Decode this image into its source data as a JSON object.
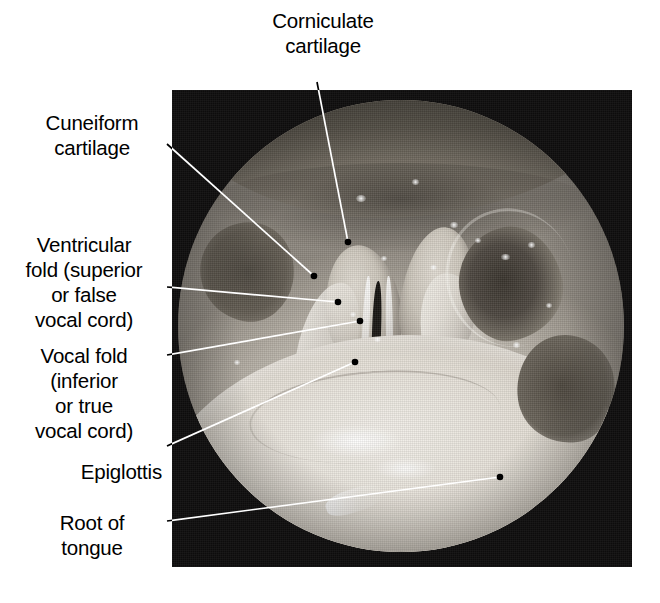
{
  "figure": {
    "type": "laryngoscopic-photograph",
    "view": "superior view of the larynx through a laryngoscope",
    "background_color": "#ffffff",
    "plate_color": "#0d0c0c",
    "leader_color_on_white": "#000000",
    "leader_color_on_photo": "#ffffff"
  },
  "labels": [
    {
      "id": "corniculate-cartilage",
      "text": "Corniculate\ncartilage",
      "align": "center",
      "x": 253,
      "y": 8,
      "width": 140
    },
    {
      "id": "cuneiform-cartilage",
      "text": "Cuneiform\ncartilage",
      "align": "center",
      "x": 22,
      "y": 110,
      "width": 140
    },
    {
      "id": "ventricular-fold",
      "text": "Ventricular\nfold (superior\nor false\nvocal cord)",
      "align": "center",
      "x": 6,
      "y": 232,
      "width": 156
    },
    {
      "id": "vocal-fold",
      "text": "Vocal fold\n(inferior\nor true\nvocal cord)",
      "align": "center",
      "x": 6,
      "y": 343,
      "width": 156
    },
    {
      "id": "epiglottis",
      "text": "Epiglottis",
      "align": "right",
      "x": 22,
      "y": 459,
      "width": 140
    },
    {
      "id": "root-of-tongue",
      "text": "Root of\ntongue",
      "align": "center",
      "x": 22,
      "y": 510,
      "width": 140
    }
  ],
  "leaders": [
    {
      "id": "leader-corniculate-cartilage",
      "points": "317,82 348,242",
      "dot": "348,242"
    },
    {
      "id": "leader-cuneiform-cartilage",
      "points": "167,144 314,276",
      "dot": "314,276"
    },
    {
      "id": "leader-ventricular-fold",
      "points": "167,287 338,302",
      "dot": "338,302"
    },
    {
      "id": "leader-vocal-fold",
      "points": "167,355 360,321",
      "dot": "360,321"
    },
    {
      "id": "leader-epiglottis",
      "points": "167,446 355,362",
      "dot": "355,362"
    },
    {
      "id": "leader-root-of-tongue",
      "points": "167,521 500,477",
      "dot": "500,477"
    }
  ],
  "anatomy_regions": [
    {
      "id": "pharyngeal-roof",
      "description": "dark supraglottic roof band across the top of the field"
    },
    {
      "id": "arytenoid-left",
      "description": "left arytenoid / corniculate eminence"
    },
    {
      "id": "arytenoid-right",
      "description": "right arytenoid / corniculate eminence"
    },
    {
      "id": "aryepiglottic-fold-left",
      "description": "left aryepiglottic fold ridge"
    },
    {
      "id": "aryepiglottic-fold-right",
      "description": "right aryepiglottic fold ridge"
    },
    {
      "id": "glottic-chink",
      "description": "dark vertical slit of the rima glottidis between the vocal folds"
    },
    {
      "id": "vocal-cord-left",
      "description": "left true vocal cord, pale edge"
    },
    {
      "id": "vocal-cord-right",
      "description": "right true vocal cord, pale edge"
    },
    {
      "id": "pyriform-recess",
      "description": "dark pyriform recess cavity right of centre"
    },
    {
      "id": "left-lateral-recess",
      "description": "dark lateral pharyngeal recess on the left"
    },
    {
      "id": "tongue-root-mass",
      "description": "large pale epiglottis and root of tongue occupying the lower half"
    }
  ],
  "glints": [
    {
      "x": 40.0,
      "y": 21.0,
      "w": 2.2,
      "h": 1.6
    },
    {
      "x": 52.5,
      "y": 17.5,
      "w": 1.6,
      "h": 1.2
    },
    {
      "x": 61.0,
      "y": 27.0,
      "w": 1.8,
      "h": 1.4
    },
    {
      "x": 66.5,
      "y": 30.5,
      "w": 1.5,
      "h": 1.1
    },
    {
      "x": 72.5,
      "y": 34.0,
      "w": 1.9,
      "h": 1.4
    },
    {
      "x": 78.5,
      "y": 31.5,
      "w": 1.5,
      "h": 1.2
    },
    {
      "x": 45.5,
      "y": 34.5,
      "w": 1.4,
      "h": 1.1
    },
    {
      "x": 56.5,
      "y": 36.5,
      "w": 1.6,
      "h": 1.2
    },
    {
      "x": 38.5,
      "y": 47.0,
      "w": 1.3,
      "h": 1.0
    },
    {
      "x": 44.0,
      "y": 52.5,
      "w": 1.5,
      "h": 1.1
    },
    {
      "x": 75.0,
      "y": 53.5,
      "w": 1.7,
      "h": 1.3
    },
    {
      "x": 12.5,
      "y": 57.5,
      "w": 1.5,
      "h": 1.2
    },
    {
      "x": 82.5,
      "y": 45.0,
      "w": 1.4,
      "h": 1.1
    }
  ]
}
